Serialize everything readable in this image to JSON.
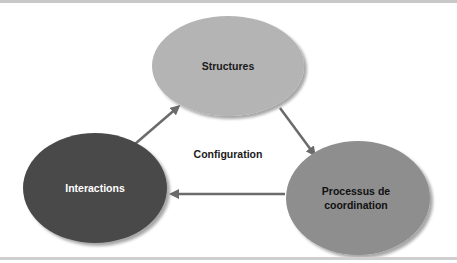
{
  "diagram": {
    "center_label": "Configuration",
    "nodes": [
      {
        "id": "structures",
        "label_lines": [
          "Structures"
        ],
        "fill": "#b4b4b4",
        "text_color": "#1a1a1a"
      },
      {
        "id": "interactions",
        "label_lines": [
          "Interactions"
        ],
        "fill": "#4a4a4a",
        "text_color": "#ffffff"
      },
      {
        "id": "processus",
        "label_lines": [
          "Processus de",
          "coordination"
        ],
        "fill": "#8e8e8e",
        "text_color": "#111111"
      }
    ],
    "edges": [
      {
        "from": "interactions",
        "to": "structures"
      },
      {
        "from": "structures",
        "to": "processus"
      },
      {
        "from": "processus",
        "to": "interactions"
      }
    ],
    "arrow_color": "#6b6b6b",
    "rule_color": "#c8c8c8"
  }
}
